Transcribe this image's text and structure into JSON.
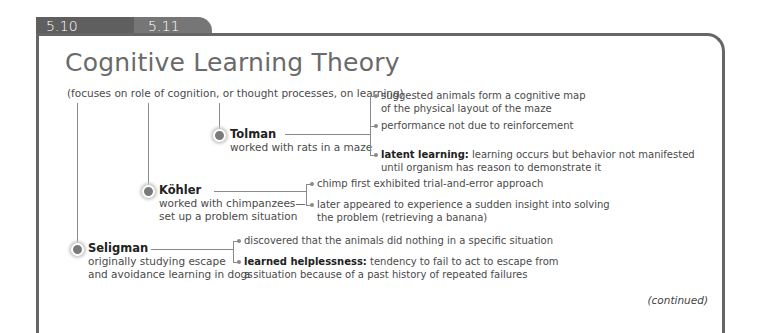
{
  "tabs": [
    {
      "label": "5.10"
    },
    {
      "label": "5.11"
    }
  ],
  "title": "Cognitive Learning Theory",
  "subtitle": "(focuses on role of cognition, or thought processes, on learning)",
  "theorists": [
    {
      "name": "Tolman",
      "description": [
        "worked with rats in a maze"
      ],
      "points": [
        {
          "term": "",
          "text": [
            "suggested animals form a cognitive map",
            "of the physical layout of the maze"
          ]
        },
        {
          "term": "",
          "text": [
            "performance not due to reinforcement"
          ]
        },
        {
          "term": "latent learning:",
          "text": [
            " learning occurs but behavior not manifested",
            "until organism has reason to demonstrate it"
          ]
        }
      ]
    },
    {
      "name": "Köhler",
      "description": [
        "worked with chimpanzees—",
        "set up a problem situation"
      ],
      "points": [
        {
          "term": "",
          "text": [
            "chimp first exhibited trial-and-error approach"
          ]
        },
        {
          "term": "",
          "text": [
            "later appeared to experience a sudden insight into solving",
            "the problem (retrieving a banana)"
          ]
        }
      ]
    },
    {
      "name": "Seligman",
      "description": [
        "originally studying escape",
        "and avoidance learning in dogs"
      ],
      "points": [
        {
          "term": "",
          "text": [
            "discovered that the animals did nothing in a specific situation"
          ]
        },
        {
          "term": "learned helplessness:",
          "text": [
            " tendency to fail to act to escape from",
            "a situation because of a past history of repeated failures"
          ]
        }
      ]
    }
  ],
  "footer": {
    "continued": "(continued)"
  },
  "colors": {
    "tab_dark": "#5f5f5f",
    "tab_light": "#767676",
    "frame": "#666666",
    "node": "#7a7a7a"
  }
}
